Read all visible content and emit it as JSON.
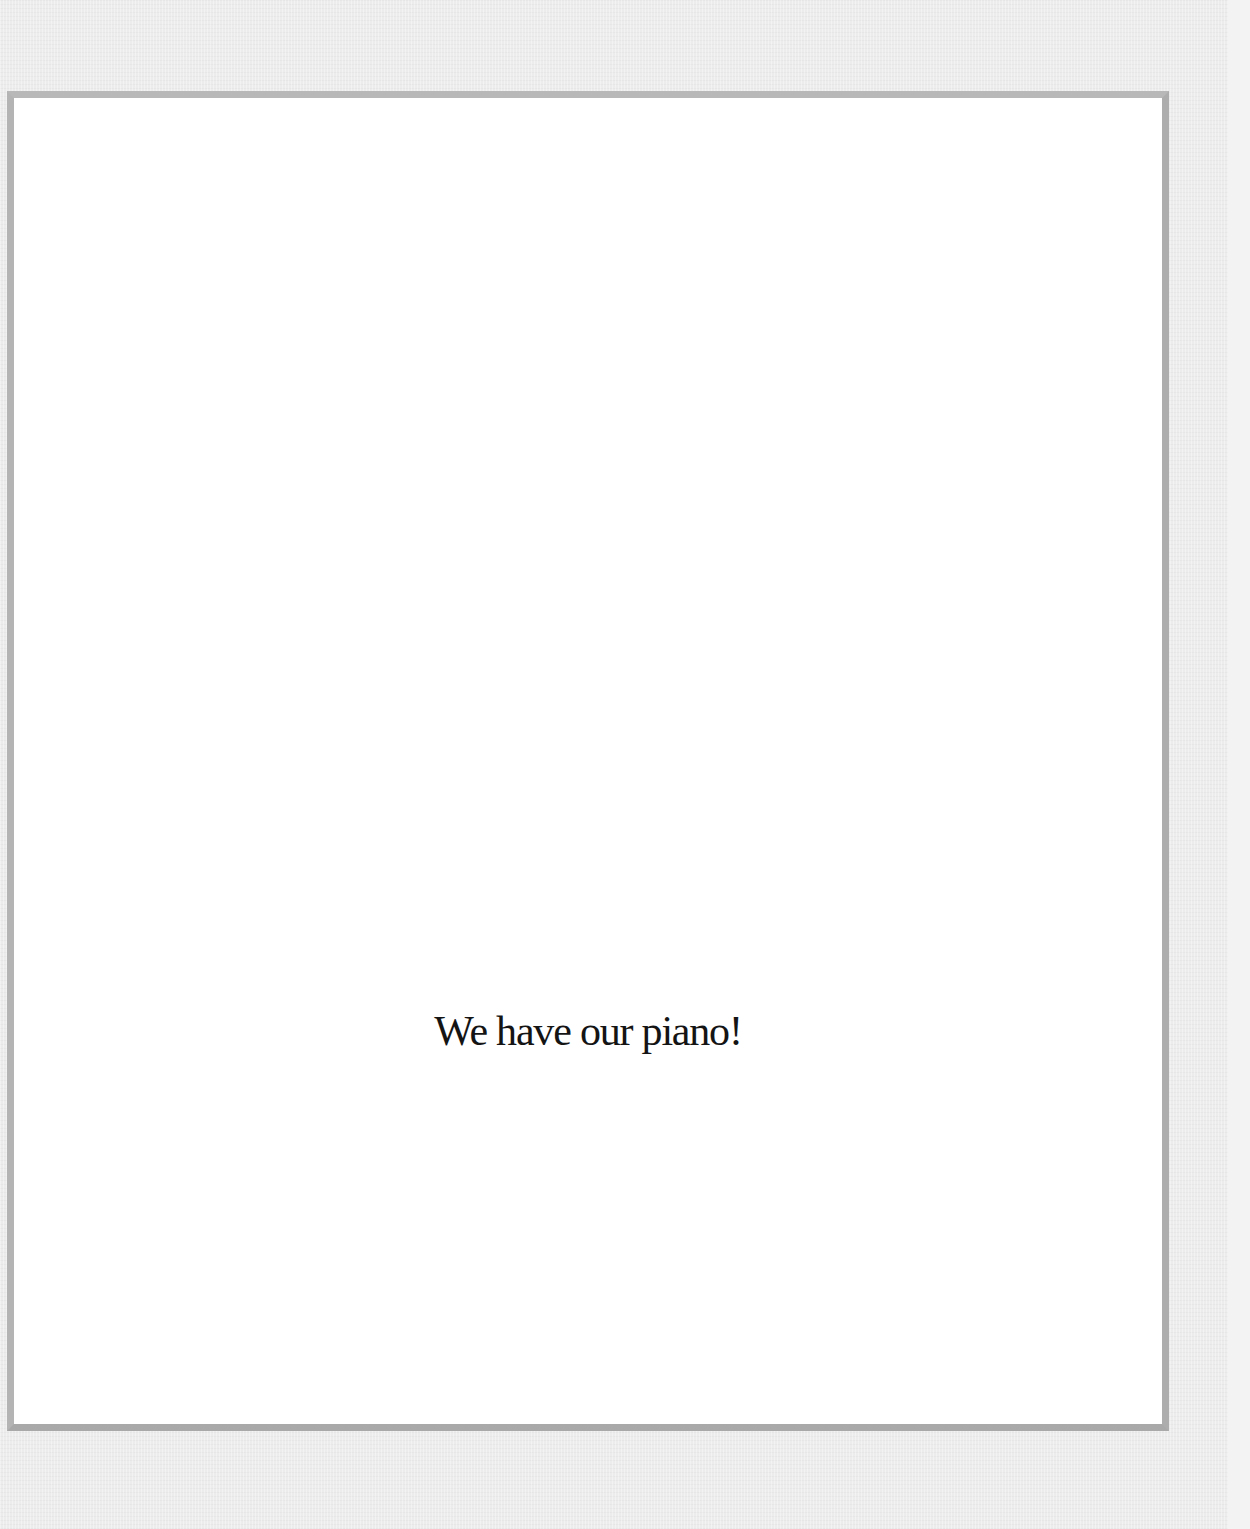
{
  "page": {
    "text": "We have our piano!",
    "colors": {
      "background": "#ececec",
      "frame_border": "#b4b4b4",
      "page_fill": "#ffffff",
      "text": "#141414"
    }
  }
}
